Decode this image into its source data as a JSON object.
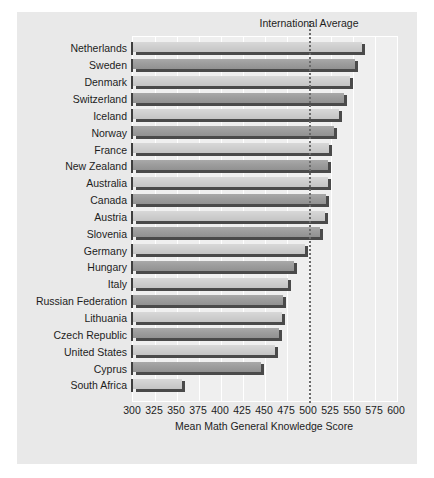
{
  "chart_data": {
    "type": "bar",
    "orientation": "horizontal",
    "title": "",
    "xlabel": "Mean Math General Knowledge Score",
    "ylabel": "",
    "xlim": [
      300,
      600
    ],
    "xticks": [
      300,
      325,
      350,
      375,
      400,
      425,
      450,
      475,
      500,
      525,
      550,
      575,
      600
    ],
    "grid": true,
    "categories": [
      "Netherlands",
      "Sweden",
      "Denmark",
      "Switzerland",
      "Iceland",
      "Norway",
      "France",
      "New Zealand",
      "Australia",
      "Canada",
      "Austria",
      "Slovenia",
      "Germany",
      "Hungary",
      "Italy",
      "Russian Federation",
      "Lithuania",
      "Czech Republic",
      "United States",
      "Cyprus",
      "South Africa"
    ],
    "values": [
      560,
      552,
      547,
      540,
      534,
      528,
      523,
      522,
      522,
      519,
      518,
      512,
      495,
      483,
      476,
      471,
      469,
      466,
      461,
      446,
      356
    ],
    "annotations": [
      {
        "label": "International Average",
        "value": 500,
        "style": "dotted-vertical-line"
      }
    ],
    "legend": null
  }
}
